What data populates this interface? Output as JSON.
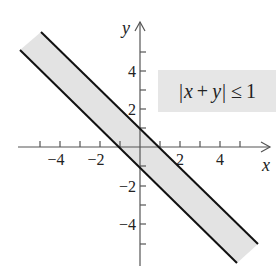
{
  "figure": {
    "type": "region-plot",
    "inequality": {
      "text": "|x + y| ≤ 1",
      "bar_left": "|",
      "var_x": "x",
      "plus": "+",
      "var_y": "y",
      "bar_right": "|",
      "leq": "≤",
      "rhs": "1"
    },
    "axes": {
      "x_label": "x",
      "y_label": "y",
      "x_ticks": [
        -5,
        -4,
        -3,
        -2,
        -1,
        1,
        2,
        3,
        4,
        5
      ],
      "y_ticks": [
        -5,
        -4,
        -3,
        -2,
        -1,
        1,
        2,
        3,
        4,
        5
      ],
      "x_tick_labels": [
        {
          "value": -4,
          "text": "−4"
        },
        {
          "value": -2,
          "text": "−2"
        },
        {
          "value": 2,
          "text": "2"
        },
        {
          "value": 4,
          "text": "4"
        }
      ],
      "y_tick_labels": [
        {
          "value": 4,
          "text": "4"
        },
        {
          "value": 2,
          "text": "2"
        },
        {
          "value": -2,
          "text": "−2"
        },
        {
          "value": -4,
          "text": "−4"
        }
      ],
      "x_range": [
        -6,
        6.5
      ],
      "y_range": [
        -6,
        6.5
      ]
    },
    "boundary_lines": [
      {
        "equation": "x + y = 1",
        "from": [
          -4.95,
          5.95
        ],
        "to": [
          5.9,
          -4.9
        ]
      },
      {
        "equation": "x + y = -1",
        "from": [
          -6,
          5
        ],
        "to": [
          4.85,
          -5.85
        ]
      }
    ],
    "colors": {
      "region_fill": "#e3e3e3",
      "line": "#111111",
      "axis": "#555555",
      "label_box": "#e6e6e6",
      "text": "#222222"
    }
  }
}
